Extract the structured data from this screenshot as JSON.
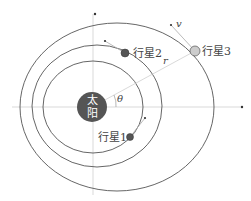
{
  "diagram": {
    "type": "orbital-diagram",
    "colors": {
      "orbit_stroke": "#555555",
      "axis_stroke": "#cfcfcf",
      "sun_fill": "#555555",
      "sun_text": "#ffffff",
      "planet_dark": "#555555",
      "planet_light": "#cccccc",
      "label": "#444444"
    },
    "sun": {
      "label_top": "太",
      "label_bottom": "阳",
      "cx": 92,
      "cy": 107,
      "r": 15
    },
    "axes": {
      "horizontal": {
        "y": 107,
        "x1": 12,
        "x2": 242
      },
      "vertical": {
        "x": 93,
        "y1": 14,
        "y2": 195
      }
    },
    "orbits": [
      {
        "name": "orbit-1",
        "cx": 93,
        "cy": 107,
        "rx": 50,
        "ry": 46
      },
      {
        "name": "orbit-2",
        "cx": 97,
        "cy": 106,
        "rx": 65,
        "ry": 61
      },
      {
        "name": "orbit-3",
        "cx": 117,
        "cy": 107,
        "rx": 97,
        "ry": 84
      }
    ],
    "planets": [
      {
        "label": "行星1",
        "cx": 130,
        "cy": 137,
        "r": 3.5,
        "tangent_dot": [
          145,
          118
        ],
        "label_x": 98,
        "label_y": 141
      },
      {
        "label": "行星2",
        "cx": 125,
        "cy": 53,
        "r": 4,
        "tangent_dot": [
          105,
          41
        ],
        "label_x": 133,
        "label_y": 57
      },
      {
        "label": "行星3",
        "cx": 195,
        "cy": 51,
        "r": 5,
        "tangent_dot": [
          171,
          25
        ],
        "label_x": 202,
        "label_y": 55
      }
    ],
    "annotations": {
      "velocity": "v",
      "radius": "r",
      "angle": "θ"
    }
  }
}
